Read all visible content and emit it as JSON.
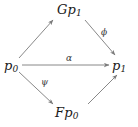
{
  "diagram": {
    "type": "commutative-diagram",
    "shape": "diamond",
    "background_color": "#ffffff",
    "stroke_color": "#7a7a7a",
    "text_color": "#1a1a1a",
    "nodes": [
      {
        "id": "gp1",
        "name": "node-gp1",
        "base": "Gp",
        "subscript": "1",
        "text": "Gp1",
        "position": "top"
      },
      {
        "id": "p0",
        "name": "node-p0",
        "base": "p",
        "subscript": "0",
        "text": "p0",
        "position": "left"
      },
      {
        "id": "p1",
        "name": "node-p1",
        "base": "p",
        "subscript": "1",
        "text": "p1",
        "position": "right"
      },
      {
        "id": "fp0",
        "name": "node-fp0",
        "base": "Fp",
        "subscript": "0",
        "text": "Fp0",
        "position": "bottom"
      }
    ],
    "edges": [
      {
        "id": "p0-gp1",
        "from": "p0",
        "to": "gp1",
        "label": "",
        "direction": "up-right"
      },
      {
        "id": "gp1-p1",
        "from": "gp1",
        "to": "p1",
        "label": "ϕ",
        "label_name": "phi",
        "direction": "down-right"
      },
      {
        "id": "p0-p1",
        "from": "p0",
        "to": "p1",
        "label": "α",
        "label_name": "alpha",
        "direction": "right"
      },
      {
        "id": "p0-fp0",
        "from": "p0",
        "to": "fp0",
        "label": "ψ",
        "label_name": "psi",
        "direction": "down-right"
      },
      {
        "id": "fp0-p1",
        "from": "fp0",
        "to": "p1",
        "label": "",
        "direction": "up-right"
      }
    ],
    "labels": {
      "phi": "ϕ",
      "alpha": "α",
      "psi": "ψ"
    }
  }
}
